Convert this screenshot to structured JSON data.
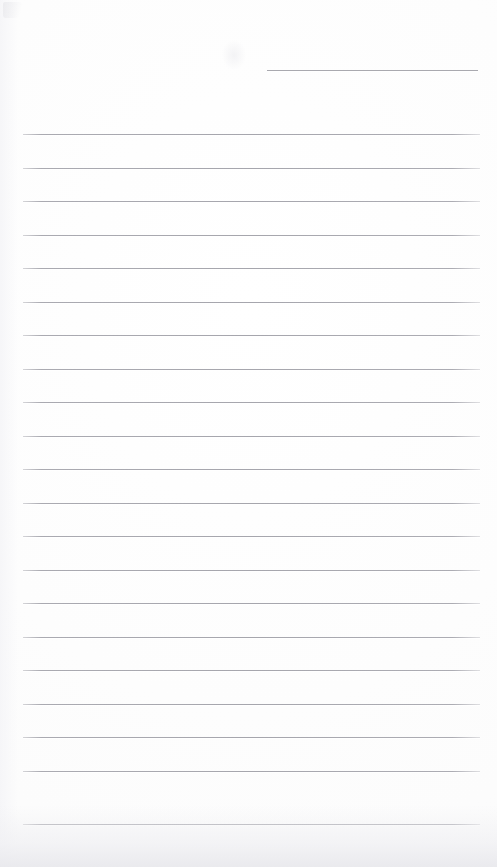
{
  "document": {
    "kind": "scanned-blank-lined-paper",
    "page_width": 497,
    "page_height": 867,
    "paper_color": "#fdfdfd",
    "rule_color": "#b6b6bb",
    "visible_text": "",
    "header_rule": {
      "label": "header-rule",
      "x": 267,
      "y": 70,
      "width": 211
    },
    "body_rules": {
      "label": "body-ruled-lines",
      "x": 23,
      "width": 457,
      "first_y": 134,
      "spacing": 33.5,
      "count": 21,
      "y_positions": [
        134,
        167.5,
        201,
        234.5,
        268,
        301.5,
        335,
        368.5,
        402,
        435.5,
        469,
        502.5,
        536,
        569.5,
        603,
        636.5,
        670,
        703.5,
        737,
        770.5,
        824
      ]
    },
    "artifacts": [
      {
        "label": "scan-artifact-topleft"
      },
      {
        "label": "scan-artifact-mid"
      },
      {
        "label": "scan-bottom-shadow"
      },
      {
        "label": "scan-left-shadow"
      }
    ]
  }
}
